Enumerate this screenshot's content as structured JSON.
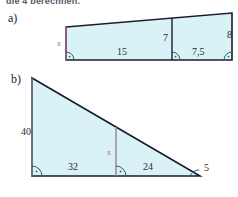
{
  "page": {
    "clipped_header_text": "die 4 berechnen.",
    "background_color": "#ffffff",
    "shape_fill_color": "#d9f2f5",
    "shape_stroke_color": "#1b1b30",
    "unknown_label_color": "#c4568e",
    "arc_color": "#2b5f6b"
  },
  "parts": [
    {
      "letter": "a)",
      "shape": "quadrilateral-with-vertical-divider",
      "labels": {
        "left_side": "x",
        "inner_vertical": "7",
        "right_side": "8",
        "bottom_left_segment": "15",
        "bottom_right_segment": "7,5"
      },
      "right_angle_marks": 3
    },
    {
      "letter": "b)",
      "shape": "right-triangle-with-vertical-divider",
      "labels": {
        "left_side": "40",
        "inner_vertical": "x",
        "bottom_left_segment": "32",
        "bottom_right_segment": "24",
        "right_side": "5"
      },
      "right_angle_marks": 3
    }
  ]
}
